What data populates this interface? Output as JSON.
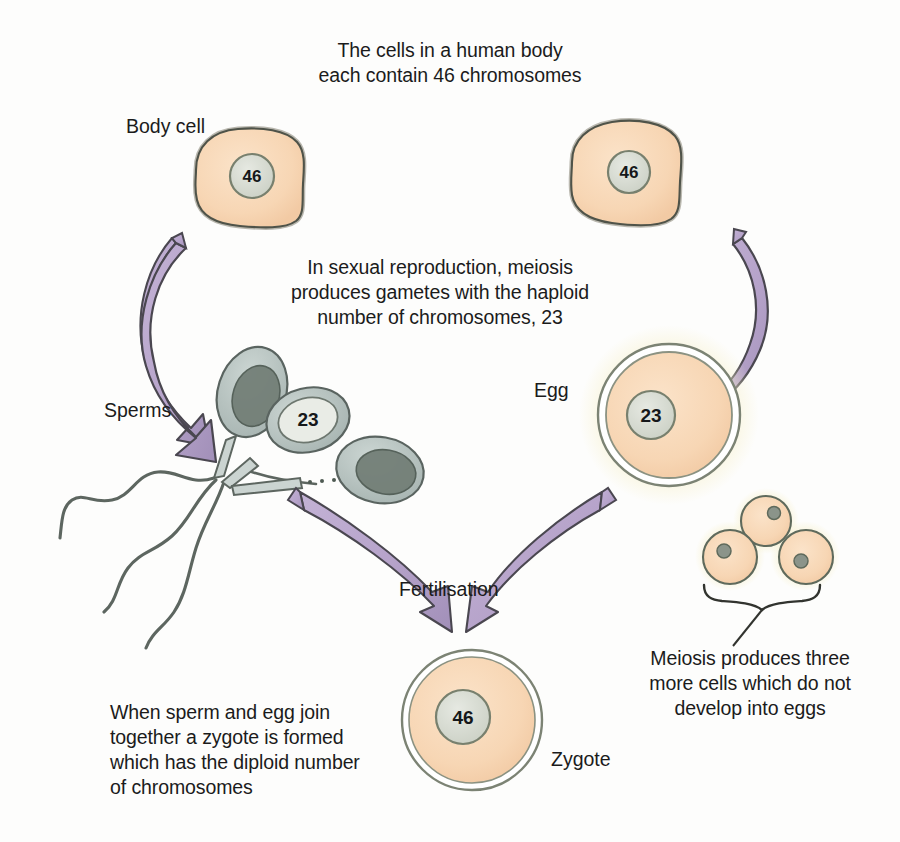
{
  "diagram": {
    "colors": {
      "cytoplasm": "#f7d6b4",
      "cytoplasm_light": "#fadcc0",
      "nucleus": "#d9dcd4",
      "nucleus_outline": "#7d8473",
      "membrane_outline": "#555b4f",
      "arrow_fill": "#b6a3ca",
      "arrow_outline": "#4d4a52",
      "sperm_head": "#b9c4c2",
      "sperm_nucleus": "#6f7b72",
      "glow": "#f6f0cf",
      "text": "#1b1b1b"
    },
    "captions": {
      "top": "The cells in a human body\neach contain 46 chromosomes",
      "middle": "In sexual reproduction, meiosis\nproduces gametes with the haploid\nnumber of chromosomes, 23",
      "bottom_left": "When sperm and egg join\ntogether a zygote is formed\nwhich has the diploid number\nof chromosomes",
      "bottom_right": "Meiosis produces three\nmore cells which do not\ndevelop into eggs"
    },
    "labels": {
      "body_cell": "Body cell",
      "sperms": "Sperms",
      "egg": "Egg",
      "fertilisation": "Fertilisation",
      "zygote": "Zygote"
    },
    "chromosome_counts": {
      "body_cell_left": "46",
      "body_cell_right": "46",
      "sperm": "23",
      "egg": "23",
      "zygote": "46"
    },
    "polar_bodies": {
      "count": 3,
      "description": "three small cells that do not develop into eggs"
    }
  }
}
